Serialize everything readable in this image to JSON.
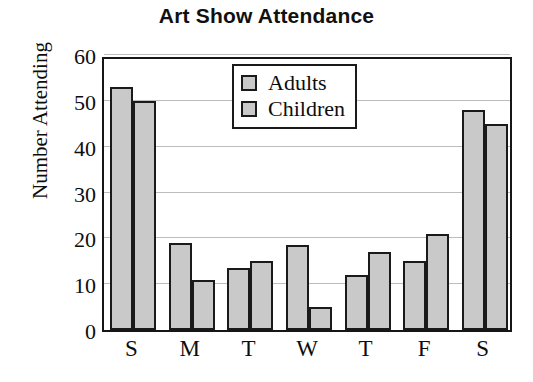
{
  "chart_data": {
    "type": "bar",
    "title": "Art Show Attendance",
    "xlabel": "",
    "ylabel": "Number Attending",
    "categories": [
      "S",
      "M",
      "T",
      "W",
      "T",
      "F",
      "S"
    ],
    "series": [
      {
        "name": "Adults",
        "values": [
          53,
          19,
          13.5,
          18.5,
          12,
          15,
          48
        ],
        "color": "#c9c9c9"
      },
      {
        "name": "Children",
        "values": [
          50,
          11,
          15,
          5,
          17,
          21,
          45
        ],
        "color": "#c9c9c9"
      }
    ],
    "ylim": [
      0,
      60
    ],
    "yticks": [
      0,
      10,
      20,
      30,
      40,
      50,
      60
    ],
    "ytick_labels": [
      "0",
      "10",
      "20",
      "30",
      "40",
      "50",
      "60"
    ],
    "grid": true,
    "grid_axis": "y",
    "legend_position": "top-center",
    "bar_edge_color": "#1a1a1a",
    "axis_color": "#161616",
    "grid_color": "#bdbdbd",
    "background": "#ffffff"
  },
  "legend": {
    "entries": [
      {
        "label": "Adults"
      },
      {
        "label": "Children"
      }
    ]
  }
}
